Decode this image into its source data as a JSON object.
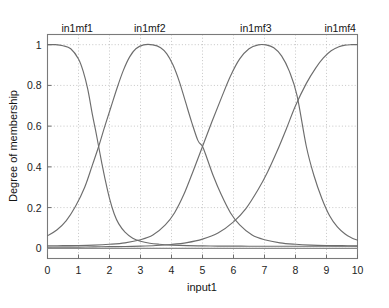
{
  "chart_data": {
    "type": "line",
    "title": "",
    "xlabel": "input1",
    "ylabel": "Degree of membership",
    "xlim": [
      0,
      10
    ],
    "ylim": [
      -0.05,
      1.05
    ],
    "grid": true,
    "legend_position": "inline-top",
    "xticks": [
      "0",
      "1",
      "2",
      "3",
      "4",
      "5",
      "6",
      "7",
      "8",
      "9",
      "10"
    ],
    "xtick_values": [
      0,
      1,
      2,
      3,
      4,
      5,
      6,
      7,
      8,
      9,
      10
    ],
    "yticks": [
      "0",
      "0.2",
      "0.4",
      "0.6",
      "0.8",
      "1"
    ],
    "ytick_values": [
      0,
      0.2,
      0.4,
      0.6,
      0.8,
      1
    ],
    "annotations": [
      {
        "text": "in1mf1",
        "x": 0.45,
        "y": 1.08
      },
      {
        "text": "in1mf2",
        "x": 3.3,
        "y": 1.08
      },
      {
        "text": "in1mf3",
        "x": 6.72,
        "y": 1.08
      },
      {
        "text": "in1mf4",
        "x": 9.95,
        "y": 1.08
      }
    ],
    "series": [
      {
        "name": "in1mf1",
        "color": "#6d6d6d",
        "x": [
          0.0,
          0.25,
          0.5,
          0.75,
          1.0,
          1.15,
          1.3,
          1.45,
          1.55,
          1.65,
          1.75,
          1.85,
          2.0,
          2.15,
          2.3,
          2.5,
          2.75,
          3.0,
          3.3,
          3.6,
          4.0,
          4.5,
          5.0,
          5.5,
          6.0,
          6.5,
          7.0,
          7.5,
          8.0,
          8.5,
          9.0,
          9.5,
          10.0
        ],
        "y": [
          1.0,
          1.0,
          0.995,
          0.98,
          0.93,
          0.87,
          0.78,
          0.655,
          0.58,
          0.5,
          0.42,
          0.345,
          0.245,
          0.17,
          0.12,
          0.08,
          0.05,
          0.035,
          0.025,
          0.02,
          0.016,
          0.013,
          0.012,
          0.011,
          0.011,
          0.01,
          0.01,
          0.01,
          0.01,
          0.01,
          0.01,
          0.01,
          0.01
        ]
      },
      {
        "name": "in1mf2",
        "color": "#6d6d6d",
        "x": [
          0.0,
          0.3,
          0.6,
          0.9,
          1.2,
          1.45,
          1.65,
          1.85,
          2.05,
          2.25,
          2.45,
          2.65,
          2.85,
          3.1,
          3.4,
          3.65,
          3.85,
          4.05,
          4.25,
          4.45,
          4.65,
          4.85,
          5.0,
          5.15,
          5.35,
          5.6,
          5.9,
          6.2,
          6.6,
          7.0,
          7.5,
          8.0,
          8.5,
          9.0,
          9.5,
          10.0
        ],
        "y": [
          0.062,
          0.09,
          0.135,
          0.205,
          0.3,
          0.41,
          0.5,
          0.6,
          0.695,
          0.79,
          0.875,
          0.94,
          0.98,
          0.999,
          0.999,
          0.985,
          0.955,
          0.9,
          0.82,
          0.72,
          0.62,
          0.53,
          0.5,
          0.44,
          0.355,
          0.265,
          0.175,
          0.115,
          0.065,
          0.042,
          0.027,
          0.02,
          0.016,
          0.014,
          0.013,
          0.012
        ]
      },
      {
        "name": "in1mf3",
        "color": "#6d6d6d",
        "x": [
          0.0,
          0.5,
          1.0,
          1.5,
          2.0,
          2.5,
          3.0,
          3.4,
          3.8,
          4.1,
          4.4,
          4.7,
          5.0,
          5.3,
          5.6,
          5.9,
          6.2,
          6.5,
          6.8,
          7.05,
          7.3,
          7.55,
          7.8,
          8.05,
          8.35,
          8.6,
          8.85,
          9.1,
          9.35,
          9.6,
          9.8,
          10.0
        ],
        "y": [
          0.012,
          0.013,
          0.014,
          0.016,
          0.02,
          0.027,
          0.042,
          0.065,
          0.115,
          0.175,
          0.265,
          0.38,
          0.5,
          0.62,
          0.735,
          0.845,
          0.93,
          0.98,
          0.999,
          0.999,
          0.985,
          0.945,
          0.87,
          0.75,
          0.5,
          0.355,
          0.245,
          0.16,
          0.105,
          0.07,
          0.052,
          0.04
        ]
      },
      {
        "name": "in1mf4",
        "color": "#6d6d6d",
        "x": [
          0.0,
          0.5,
          1.0,
          1.5,
          2.0,
          2.5,
          3.0,
          3.5,
          4.0,
          4.5,
          5.0,
          5.5,
          6.0,
          6.4,
          6.8,
          7.1,
          7.4,
          7.7,
          8.0,
          8.35,
          8.65,
          8.9,
          9.15,
          9.4,
          9.6,
          9.8,
          10.0
        ],
        "y": [
          0.005,
          0.006,
          0.006,
          0.007,
          0.008,
          0.009,
          0.011,
          0.014,
          0.019,
          0.028,
          0.045,
          0.075,
          0.13,
          0.195,
          0.29,
          0.375,
          0.475,
          0.585,
          0.7,
          0.81,
          0.885,
          0.935,
          0.97,
          0.99,
          0.998,
          1.0,
          1.0
        ]
      }
    ]
  },
  "axes": {
    "xlabel": "input1",
    "ylabel": "Degree of membership"
  }
}
